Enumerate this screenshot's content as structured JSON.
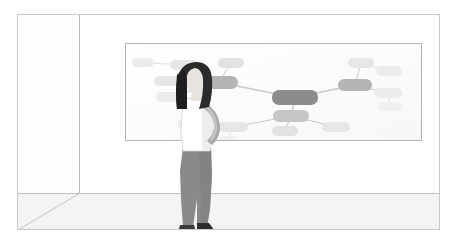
{
  "scene": {
    "title": "Woman looking at a mind map on a whiteboard",
    "description": "Illustration of a room in perspective with a large whiteboard on the back wall showing a grey mind-map diagram, and a standing woman in profile viewing it.",
    "background_color": "#ffffff",
    "frame_border_color": "#c9c9c9"
  },
  "room": {
    "back_wall_label": "back wall",
    "left_wall_label": "left wall",
    "floor_label": "floor",
    "wall_color": "#ffffff",
    "floor_color": "#f4f4f4",
    "edge_color": "#c2c2c2"
  },
  "whiteboard": {
    "label": "whiteboard",
    "board_color": "#ffffff",
    "frame_color": "#b5b5b5"
  },
  "person": {
    "label": "standing woman viewing whiteboard",
    "pose": "profile, facing right, arm bent at elbow",
    "hair_color": "#2b2b2b",
    "skin_color": "#e8e4df",
    "top_color": "#ffffff",
    "pants_color": "#8a8a8a",
    "shoe_color": "#3a3a3a"
  },
  "chart_data": {
    "type": "diagram",
    "diagram_type": "mind-map",
    "title": "",
    "palette": {
      "root": "#8c8c8c",
      "branch": "#b4b4b4",
      "leaf": "#dcdcdc",
      "leaf_faint": "#ececec",
      "connector": "#c8c8c8",
      "connector_faint": "#e0e0e0"
    },
    "nodes": [
      {
        "id": "root",
        "label": "",
        "level": 0,
        "x": 146,
        "y": 46,
        "w": 46,
        "h": 15,
        "fill": "#8c8c8c"
      },
      {
        "id": "b-left",
        "label": "",
        "level": 1,
        "x": 74,
        "y": 32,
        "w": 38,
        "h": 13,
        "fill": "#b4b4b4"
      },
      {
        "id": "b-right",
        "label": "",
        "level": 1,
        "x": 212,
        "y": 35,
        "w": 34,
        "h": 12,
        "fill": "#b4b4b4"
      },
      {
        "id": "b-bottom",
        "label": "",
        "level": 1,
        "x": 147,
        "y": 66,
        "w": 36,
        "h": 12,
        "fill": "#c6c6c6"
      },
      {
        "id": "l-top",
        "label": "",
        "level": 2,
        "x": 92,
        "y": 14,
        "w": 26,
        "h": 10,
        "fill": "#e2e2e2"
      },
      {
        "id": "l-upleft",
        "label": "",
        "level": 2,
        "x": 44,
        "y": 16,
        "w": 28,
        "h": 10,
        "fill": "#e6e6e6"
      },
      {
        "id": "l-farleft",
        "label": "",
        "level": 2,
        "x": 6,
        "y": 14,
        "w": 22,
        "h": 9,
        "fill": "#ececec"
      },
      {
        "id": "l-midleft",
        "label": "",
        "level": 2,
        "x": 28,
        "y": 32,
        "w": 30,
        "h": 10,
        "fill": "#e6e6e6"
      },
      {
        "id": "l-lowleft",
        "label": "",
        "level": 2,
        "x": 30,
        "y": 48,
        "w": 30,
        "h": 10,
        "fill": "#ececec"
      },
      {
        "id": "r-up",
        "label": "",
        "level": 2,
        "x": 222,
        "y": 14,
        "w": 26,
        "h": 10,
        "fill": "#e6e6e6"
      },
      {
        "id": "r-upfar",
        "label": "",
        "level": 2,
        "x": 250,
        "y": 22,
        "w": 26,
        "h": 10,
        "fill": "#ececec"
      },
      {
        "id": "r-mid",
        "label": "",
        "level": 2,
        "x": 248,
        "y": 44,
        "w": 28,
        "h": 10,
        "fill": "#ececec"
      },
      {
        "id": "r-low",
        "label": "",
        "level": 2,
        "x": 252,
        "y": 58,
        "w": 24,
        "h": 9,
        "fill": "#f0f0f0"
      },
      {
        "id": "bt-left",
        "label": "",
        "level": 2,
        "x": 92,
        "y": 78,
        "w": 30,
        "h": 10,
        "fill": "#e6e6e6"
      },
      {
        "id": "bt-farleft",
        "label": "",
        "level": 2,
        "x": 52,
        "y": 76,
        "w": 26,
        "h": 9,
        "fill": "#ececec"
      },
      {
        "id": "bt-mid",
        "label": "",
        "level": 2,
        "x": 146,
        "y": 82,
        "w": 26,
        "h": 10,
        "fill": "#e2e2e2"
      },
      {
        "id": "bt-right",
        "label": "",
        "level": 2,
        "x": 196,
        "y": 78,
        "w": 28,
        "h": 10,
        "fill": "#e6e6e6"
      },
      {
        "id": "bt-stub",
        "label": "",
        "level": 3,
        "x": 94,
        "y": 92,
        "w": 16,
        "h": 7,
        "fill": "#f0f0f0"
      }
    ],
    "edges": [
      {
        "from": "root",
        "to": "b-left"
      },
      {
        "from": "root",
        "to": "b-right"
      },
      {
        "from": "root",
        "to": "b-bottom"
      },
      {
        "from": "b-left",
        "to": "l-top"
      },
      {
        "from": "b-left",
        "to": "l-upleft"
      },
      {
        "from": "b-left",
        "to": "l-midleft"
      },
      {
        "from": "b-left",
        "to": "l-lowleft"
      },
      {
        "from": "l-upleft",
        "to": "l-farleft"
      },
      {
        "from": "b-right",
        "to": "r-up"
      },
      {
        "from": "r-up",
        "to": "r-upfar"
      },
      {
        "from": "b-right",
        "to": "r-mid"
      },
      {
        "from": "r-mid",
        "to": "r-low"
      },
      {
        "from": "b-bottom",
        "to": "bt-left"
      },
      {
        "from": "bt-left",
        "to": "bt-farleft"
      },
      {
        "from": "b-bottom",
        "to": "bt-mid"
      },
      {
        "from": "b-bottom",
        "to": "bt-right"
      },
      {
        "from": "bt-left",
        "to": "bt-stub"
      }
    ]
  }
}
